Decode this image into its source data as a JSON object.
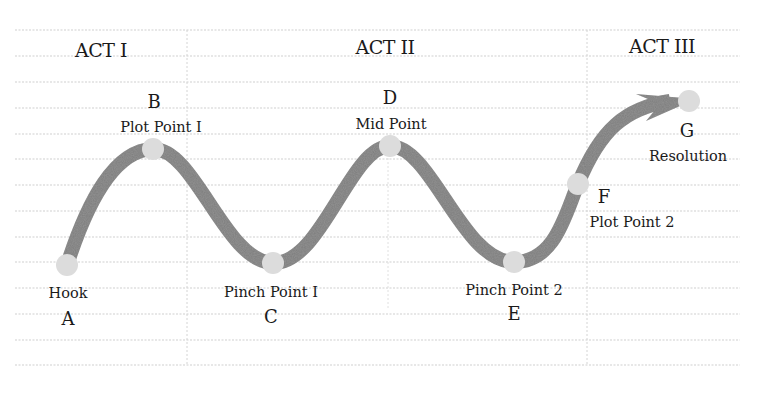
{
  "diagram": {
    "type": "story-structure-wave",
    "acts": [
      {
        "label": "ACT I",
        "x": 101,
        "y": 57
      },
      {
        "label": "ACT II",
        "x": 385,
        "y": 54
      },
      {
        "label": "ACT III",
        "x": 662,
        "y": 53
      }
    ],
    "points": [
      {
        "letter": "A",
        "caption": "Hook",
        "x": 67,
        "y": 265,
        "letter_pos": [
          68,
          325
        ],
        "caption_pos": [
          68,
          298
        ]
      },
      {
        "letter": "B",
        "caption": "Plot Point I",
        "x": 153,
        "y": 149,
        "letter_pos": [
          154,
          108
        ],
        "caption_pos": [
          161,
          132
        ]
      },
      {
        "letter": "C",
        "caption": "Pinch Point I",
        "x": 273,
        "y": 263,
        "letter_pos": [
          271,
          323
        ],
        "caption_pos": [
          271,
          297
        ]
      },
      {
        "letter": "D",
        "caption": "Mid Point",
        "x": 390,
        "y": 146,
        "letter_pos": [
          390,
          104
        ],
        "caption_pos": [
          391,
          129
        ]
      },
      {
        "letter": "E",
        "caption": "Pinch Point 2",
        "x": 514,
        "y": 262,
        "letter_pos": [
          514,
          320
        ],
        "caption_pos": [
          514,
          295
        ]
      },
      {
        "letter": "F",
        "caption": "Plot Point 2",
        "x": 578,
        "y": 184,
        "letter_pos": [
          604,
          203
        ],
        "caption_pos": [
          632,
          227
        ]
      },
      {
        "letter": "G",
        "caption": "Resolution",
        "x": 689,
        "y": 101,
        "letter_pos": [
          687,
          137
        ],
        "caption_pos": [
          688,
          161
        ]
      }
    ],
    "colors": {
      "curve": "#7d7d7d",
      "node": "#dcdcdc",
      "grid": "#cfcfcf",
      "text": "#1a1a1a"
    }
  }
}
